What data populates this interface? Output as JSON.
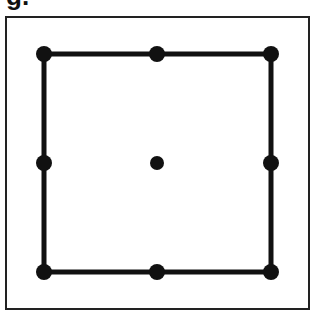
{
  "figure": {
    "label": "g.",
    "frame": {
      "x": 6,
      "y": 17,
      "width": 303,
      "height": 292,
      "stroke": "#222222"
    },
    "square": {
      "x1": 44,
      "y1": 54,
      "x2": 271,
      "y2": 272,
      "stroke": "#111111",
      "stroke_width": 5
    },
    "dots": [
      {
        "name": "top-left",
        "x": 44,
        "y": 54
      },
      {
        "name": "top-middle",
        "x": 157,
        "y": 54
      },
      {
        "name": "top-right",
        "x": 271,
        "y": 54
      },
      {
        "name": "middle-left",
        "x": 44,
        "y": 163
      },
      {
        "name": "center",
        "x": 157,
        "y": 163
      },
      {
        "name": "middle-right",
        "x": 271,
        "y": 163
      },
      {
        "name": "bottom-left",
        "x": 44,
        "y": 272
      },
      {
        "name": "bottom-middle",
        "x": 157,
        "y": 272
      },
      {
        "name": "bottom-right",
        "x": 271,
        "y": 272
      }
    ],
    "dot_radius": 8,
    "dot_color": "#111111"
  }
}
